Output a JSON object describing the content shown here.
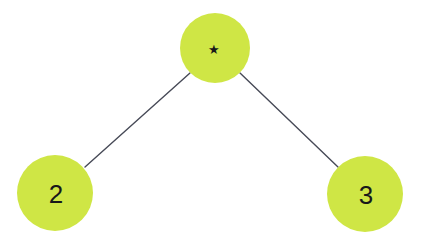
{
  "diagram": {
    "type": "binary-tree",
    "background_color": "#ffffff",
    "node_fill_color": "#cfe645",
    "edge_color": "#474a57",
    "label_color": "#18181a",
    "nodes": [
      {
        "id": "root",
        "label": "★",
        "icon": "star-icon",
        "cx": 215,
        "cy": 48,
        "r": 35
      },
      {
        "id": "left-child",
        "label": "2",
        "cx": 55,
        "cy": 193,
        "r": 38
      },
      {
        "id": "right-child",
        "label": "3",
        "cx": 365,
        "cy": 194,
        "r": 38
      }
    ],
    "edges": [
      {
        "id": "root-to-left",
        "from": "root",
        "to": "left-child",
        "x1": 190,
        "y1": 73,
        "x2": 85,
        "y2": 167
      },
      {
        "id": "root-to-right",
        "from": "root",
        "to": "right-child",
        "x1": 240,
        "y1": 73,
        "x2": 338,
        "y2": 167
      }
    ]
  }
}
